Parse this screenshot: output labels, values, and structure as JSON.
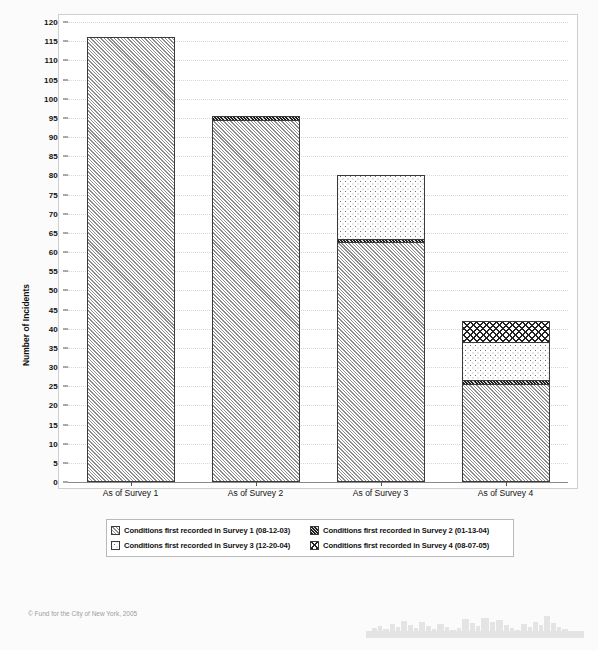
{
  "chart_data": {
    "type": "bar",
    "subtype": "stacked",
    "title": "",
    "xlabel": "",
    "ylabel": "Number of Incidents",
    "ylim": [
      0,
      120
    ],
    "ytick_step": 5,
    "yticks": [
      "0",
      "5",
      "10",
      "15",
      "20",
      "25",
      "30",
      "35",
      "40",
      "45",
      "50",
      "55",
      "60",
      "65",
      "70",
      "75",
      "80",
      "85",
      "90",
      "95",
      "100",
      "105",
      "110",
      "115",
      "120"
    ],
    "grid": true,
    "legend_position": "bottom",
    "categories": [
      "As of Survey 1",
      "As of Survey 2",
      "As of Survey 3",
      "As of Survey 4"
    ],
    "series": [
      {
        "name": "Conditions first recorded in Survey 1 (08-12-03)",
        "pattern": "diagonal-hatch-gray",
        "values": [
          116,
          94,
          62,
          25
        ]
      },
      {
        "name": "Conditions first recorded in Survey 2 (01-13-04)",
        "pattern": "dense-dark-diagonal-hatch",
        "values": [
          0,
          1.5,
          1,
          1
        ]
      },
      {
        "name": "Conditions first recorded in Survey 3 (12-20-04)",
        "pattern": "light-dotted",
        "values": [
          0,
          0,
          17,
          10
        ]
      },
      {
        "name": "Conditions first recorded in Survey 4 (08-07-05)",
        "pattern": "crosshatch",
        "values": [
          0,
          0,
          0,
          6
        ]
      }
    ],
    "totals": [
      116,
      95.5,
      80,
      42
    ],
    "annotations": []
  },
  "legend": {
    "items": [
      {
        "label": "Conditions first recorded in Survey 1 (08-12-03)",
        "pattern": "pat-s1"
      },
      {
        "label": "Conditions first recorded in Survey 2 (01-13-04)",
        "pattern": "pat-s2"
      },
      {
        "label": "Conditions first recorded in Survey 3 (12-20-04)",
        "pattern": "pat-s3"
      },
      {
        "label": "Conditions first recorded in Survey 4 (08-07-05)",
        "pattern": "pat-s4"
      }
    ]
  },
  "footer": {
    "credit": "© Fund for the City of New York, 2005",
    "decoration": "city-skyline"
  },
  "colors": {
    "survey1_hatch": "#8d8d8d",
    "survey2_hatch": "#1d1d1d",
    "survey3_dot": "#6f6f6f",
    "survey4_hatch": "#232323",
    "gridline": "#d8d8d8",
    "axis": "#555555",
    "frame": "#cfcfcf",
    "page_background": "#fbfbfb",
    "plot_background": "#ffffff",
    "footer_text": "#9b9b9b"
  }
}
